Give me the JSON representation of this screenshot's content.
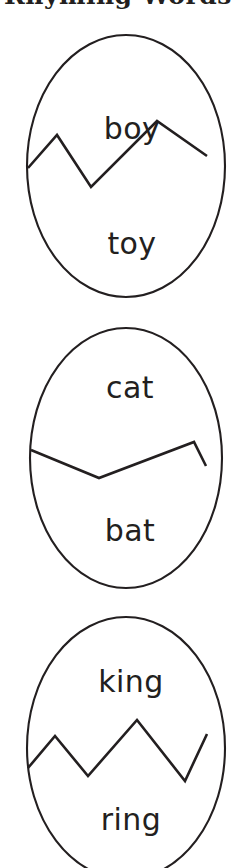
{
  "worksheet": {
    "heading": "Rhyming Words",
    "heading_clipped": true,
    "background_color": "#ffffff",
    "ink_color": "#231f20"
  },
  "eggs": [
    {
      "id": "egg-1",
      "top_word": "boy",
      "bottom_word": "toy",
      "crack_style": "zigzag-two-peaks",
      "crack_points": "0,78 28,44 62,96 128,30 178,66"
    },
    {
      "id": "egg-2",
      "top_word": "cat",
      "bottom_word": "bat",
      "crack_style": "shallow-single-peak",
      "crack_points": "0,64 72,92 168,56 178,78"
    },
    {
      "id": "egg-3",
      "top_word": "king",
      "bottom_word": "ring",
      "crack_style": "zigzag-two-peaks-rising",
      "crack_points": "0,86 26,56 60,96 110,40 158,100 178,56"
    }
  ]
}
